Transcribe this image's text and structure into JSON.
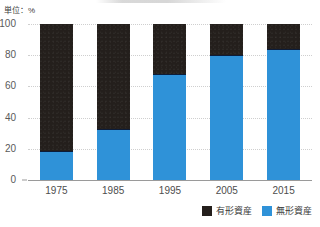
{
  "unit_label": "単位：%",
  "legend": {
    "position": "bottom-right",
    "items": [
      {
        "label": "有形資産",
        "color": "#241f1c",
        "swatch_name": "tangible"
      },
      {
        "label": "無形資産",
        "color": "#2f92d8",
        "swatch_name": "intangible"
      }
    ]
  },
  "axis": {
    "yticks": [
      "100",
      "80",
      "60",
      "40",
      "20",
      "0"
    ],
    "xlabels": [
      "1975",
      "1985",
      "1995",
      "2005",
      "2015"
    ]
  },
  "chart_data": {
    "type": "bar",
    "stacked": true,
    "stack_total": 100,
    "title": "",
    "xlabel": "",
    "ylabel": "単位：%",
    "ylim": [
      0,
      100
    ],
    "yticks": [
      0,
      20,
      40,
      60,
      80,
      100
    ],
    "grid": true,
    "legend_position": "bottom-right",
    "categories": [
      "1975",
      "1985",
      "1995",
      "2005",
      "2015"
    ],
    "series": [
      {
        "name": "無形資産",
        "color": "#2f92d8",
        "values": [
          18,
          32,
          68,
          80,
          84
        ]
      },
      {
        "name": "有形資産",
        "color": "#241f1c",
        "values": [
          82,
          68,
          32,
          20,
          16
        ]
      }
    ]
  }
}
